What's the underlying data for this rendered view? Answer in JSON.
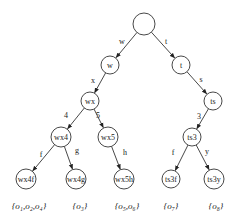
{
  "diagram": {
    "type": "trie",
    "nodes": [
      {
        "id": "root",
        "label": "",
        "x": 144,
        "y": 24,
        "r": 11
      },
      {
        "id": "w",
        "label": "w",
        "x": 110,
        "y": 65,
        "r": 9
      },
      {
        "id": "t",
        "label": "t",
        "x": 181,
        "y": 65,
        "r": 9
      },
      {
        "id": "wx",
        "label": "wx",
        "x": 90,
        "y": 101,
        "r": 9
      },
      {
        "id": "ts",
        "label": "ts",
        "x": 213,
        "y": 101,
        "r": 9
      },
      {
        "id": "wx4",
        "label": "wx4",
        "x": 61,
        "y": 137,
        "r": 10
      },
      {
        "id": "wx5",
        "label": "wx5",
        "x": 108,
        "y": 137,
        "r": 10
      },
      {
        "id": "ts3",
        "label": "ts3",
        "x": 192,
        "y": 137,
        "r": 9
      },
      {
        "id": "wx4f",
        "label": "wx4f",
        "x": 26,
        "y": 179,
        "r": 10
      },
      {
        "id": "wx4g",
        "label": "wx4g",
        "x": 76,
        "y": 179,
        "r": 10
      },
      {
        "id": "wx5h",
        "label": "wx5h",
        "x": 124,
        "y": 179,
        "r": 10
      },
      {
        "id": "ts3f",
        "label": "ts3f",
        "x": 171,
        "y": 179,
        "r": 9
      },
      {
        "id": "ts3y",
        "label": "ts3y",
        "x": 214,
        "y": 179,
        "r": 10
      }
    ],
    "edges": [
      {
        "from": "root",
        "to": "w",
        "label": "w",
        "lx": 122,
        "ly": 41
      },
      {
        "from": "root",
        "to": "t",
        "label": "t",
        "lx": 166,
        "ly": 41
      },
      {
        "from": "w",
        "to": "wx",
        "label": "x",
        "lx": 93,
        "ly": 80
      },
      {
        "from": "t",
        "to": "ts",
        "label": "s",
        "lx": 201,
        "ly": 79
      },
      {
        "from": "wx",
        "to": "wx4",
        "label": "4",
        "lx": 66,
        "ly": 115
      },
      {
        "from": "wx",
        "to": "wx5",
        "label": "5",
        "lx": 98,
        "ly": 115
      },
      {
        "from": "ts",
        "to": "ts3",
        "label": "3",
        "lx": 199,
        "ly": 116
      },
      {
        "from": "wx4",
        "to": "wx4f",
        "label": "f",
        "lx": 41,
        "ly": 154
      },
      {
        "from": "wx4",
        "to": "wx4g",
        "label": "g",
        "lx": 77,
        "ly": 150
      },
      {
        "from": "wx5",
        "to": "wx5h",
        "label": "h",
        "lx": 125,
        "ly": 152
      },
      {
        "from": "ts3",
        "to": "ts3f",
        "label": "f",
        "lx": 173,
        "ly": 152
      },
      {
        "from": "ts3",
        "to": "ts3y",
        "label": "y",
        "lx": 207,
        "ly": 151
      }
    ],
    "leaf_sets": [
      {
        "leaf": "wx4f",
        "text": "{o1,o2,o4}",
        "display": "{o₁,o₂,o₄}",
        "x": 29,
        "y": 209
      },
      {
        "leaf": "wx4g",
        "text": "{o3}",
        "display": "{o₃}",
        "x": 80,
        "y": 209
      },
      {
        "leaf": "wx5h",
        "text": "{o5,o6}",
        "display": "{o₅,o₆}",
        "x": 127,
        "y": 209
      },
      {
        "leaf": "ts3f",
        "text": "{o7}",
        "display": "{o₇}",
        "x": 171,
        "y": 209
      },
      {
        "leaf": "ts3y",
        "text": "{o8}",
        "display": "{o₈}",
        "x": 216,
        "y": 209
      }
    ],
    "colors": {
      "stroke": "#333333",
      "text": "#222222",
      "background": "#ffffff"
    }
  }
}
